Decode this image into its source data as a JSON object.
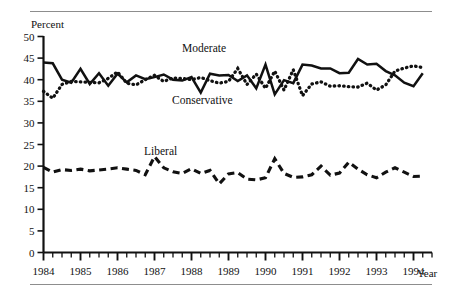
{
  "figure": {
    "ylabel": "Percent",
    "xlabel": "Year",
    "labels": {
      "moderate": "Moderate",
      "conservative": "Conservative",
      "liberal": "Liberal"
    }
  },
  "chart_data": {
    "type": "line",
    "title": "",
    "subtitle": "",
    "xlabel": "Year",
    "ylabel": "Percent",
    "xlim": [
      1984.0,
      1994.5
    ],
    "ylim": [
      0,
      50
    ],
    "yticks": [
      0,
      5,
      10,
      15,
      20,
      25,
      30,
      35,
      40,
      45,
      50
    ],
    "ytick_labels": [
      "0",
      "5",
      "10",
      "15",
      "20",
      "25",
      "30",
      "35",
      "40",
      "45",
      "50"
    ],
    "xticks": [
      1984,
      1985,
      1986,
      1987,
      1988,
      1989,
      1990,
      1991,
      1992,
      1993,
      1994
    ],
    "xtick_labels": [
      "1984",
      "1985",
      "1986",
      "1987",
      "1988",
      "1989",
      "1990",
      "1991",
      "1992",
      "1993",
      "1994"
    ],
    "minor_xticks_per_year": 4,
    "grid": false,
    "legend": "inline-annotations",
    "x": [
      1984.0,
      1984.25,
      1984.5,
      1984.75,
      1985.0,
      1985.25,
      1985.5,
      1985.75,
      1986.0,
      1986.25,
      1986.5,
      1986.75,
      1987.0,
      1987.25,
      1987.5,
      1987.75,
      1988.0,
      1988.25,
      1988.5,
      1988.75,
      1989.0,
      1989.25,
      1989.5,
      1989.75,
      1990.0,
      1990.25,
      1990.5,
      1990.75,
      1991.0,
      1991.25,
      1991.5,
      1991.75,
      1992.0,
      1992.25,
      1992.5,
      1992.75,
      1993.0,
      1993.25,
      1993.5,
      1993.75,
      1994.0,
      1994.25
    ],
    "series": [
      {
        "name": "Moderate",
        "style": "solid",
        "color": "#111111",
        "values": [
          44.0,
          43.8,
          40.0,
          39.3,
          42.5,
          39.0,
          41.5,
          38.6,
          41.4,
          39.4,
          41.0,
          40.1,
          40.6,
          41.2,
          40.0,
          39.8,
          40.6,
          37.0,
          41.4,
          41.0,
          41.1,
          39.7,
          41.0,
          38.0,
          43.5,
          36.6,
          39.9,
          39.2,
          43.5,
          43.3,
          42.6,
          42.6,
          41.5,
          41.6,
          44.8,
          43.5,
          43.7,
          42.0,
          41.0,
          39.3,
          38.5,
          41.5
        ]
      },
      {
        "name": "Conservative",
        "style": "dotted",
        "color": "#111111",
        "values": [
          37.3,
          35.7,
          38.9,
          39.6,
          39.5,
          39.4,
          39.3,
          40.3,
          41.8,
          39.2,
          38.8,
          40.0,
          41.0,
          39.6,
          40.4,
          40.3,
          40.0,
          40.5,
          39.8,
          39.2,
          39.6,
          42.6,
          38.9,
          41.3,
          38.0,
          42.0,
          37.6,
          42.3,
          36.3,
          39.0,
          39.5,
          38.5,
          38.6,
          38.4,
          38.3,
          39.2,
          37.6,
          38.8,
          42.0,
          42.7,
          43.2,
          42.8
        ]
      },
      {
        "name": "Liberal",
        "style": "dashed",
        "color": "#111111",
        "values": [
          19.7,
          18.6,
          19.2,
          19.0,
          19.3,
          18.9,
          19.1,
          19.3,
          19.6,
          19.3,
          19.0,
          18.0,
          22.2,
          19.6,
          18.7,
          18.3,
          19.4,
          18.3,
          19.0,
          15.9,
          18.2,
          18.5,
          17.0,
          16.8,
          17.3,
          21.7,
          18.3,
          17.4,
          17.5,
          18.0,
          20.0,
          17.9,
          18.4,
          20.9,
          19.3,
          18.0,
          17.3,
          18.6,
          19.6,
          18.6,
          17.6,
          17.7
        ]
      }
    ]
  }
}
